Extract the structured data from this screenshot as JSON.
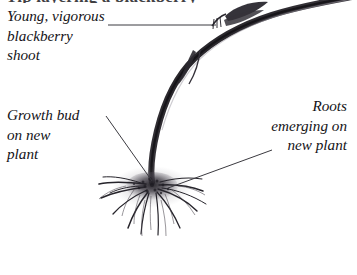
{
  "figure": {
    "kind": "botanical-illustration",
    "background_color": "#ffffff",
    "ink_color": "#141317"
  },
  "headline": {
    "text": "Tip layering a blackberry",
    "note": "cropped at top edge, only descenders visible"
  },
  "labels": {
    "shoot": {
      "text": "Young, vigorous\nblackberry\nshoot",
      "align": "left"
    },
    "growth_bud": {
      "text": "Growth bud\non new\nplant",
      "align": "left"
    },
    "roots": {
      "text": "Roots\nemerging on\nnew plant",
      "align": "right"
    }
  },
  "leaders": [
    {
      "name": "shoot-leader",
      "from": [
        108,
        25
      ],
      "to": [
        216,
        25
      ],
      "style": "horizontal",
      "color": "#3b3a40"
    },
    {
      "name": "growth-bud-leader",
      "from": [
        106,
        116
      ],
      "to": [
        152,
        181
      ],
      "style": "diagonal",
      "color": "#3b3a40"
    },
    {
      "name": "roots-leader",
      "from": [
        168,
        188
      ],
      "to": [
        272,
        150
      ],
      "style": "diagonal",
      "color": "#3b3a40"
    }
  ],
  "illustration": {
    "cane": {
      "name": "arching blackberry cane",
      "enters_at": [
        305,
        0
      ],
      "meets_soil_at": [
        152,
        181
      ],
      "color": "#2e2c31"
    },
    "root_mass": {
      "name": "fibrous root cluster at cane tip",
      "center": [
        154,
        186
      ],
      "spread_left": 100,
      "spread_right": 215,
      "spread_bottom": 252,
      "color": "#24222a"
    },
    "leaf_node": {
      "name": "dark leaf and bud node on cane",
      "center": [
        243,
        14
      ]
    }
  }
}
